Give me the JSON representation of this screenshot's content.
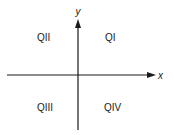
{
  "diagram": {
    "type": "coordinate-plane-quadrants",
    "axes": {
      "x_label": "x",
      "y_label": "y"
    },
    "quadrants": {
      "q1": "QI",
      "q2": "QII",
      "q3": "QIII",
      "q4": "QIV"
    },
    "colors": {
      "axis": "#1a1a1a",
      "text": "#222222",
      "background": "#ffffff"
    }
  }
}
